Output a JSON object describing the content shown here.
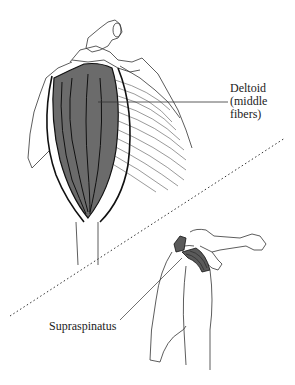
{
  "figure": {
    "top_view": {
      "muscle_label": [
        "Deltoid",
        "(middle",
        "fibers)"
      ],
      "muscle_color": "#6b6b6b"
    },
    "bottom_view": {
      "muscle_label": "Supraspinatus",
      "muscle_color": "#5a5a5a"
    },
    "divider": "dotted-diagonal"
  }
}
